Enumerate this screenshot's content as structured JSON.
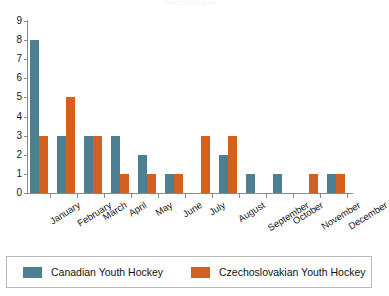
{
  "chart_data": {
    "type": "bar",
    "title": "Youth Hockey",
    "xlabel": "",
    "ylabel": "",
    "ylim": [
      0,
      9
    ],
    "yticks": [
      0,
      1,
      2,
      3,
      4,
      5,
      6,
      7,
      8,
      9
    ],
    "grid": false,
    "legend_position": "bottom",
    "categories": [
      "January",
      "February",
      "March",
      "April",
      "May",
      "June",
      "July",
      "August",
      "September",
      "October",
      "November",
      "December"
    ],
    "series": [
      {
        "name": "Canadian Youth Hockey",
        "color": "#4d7f92",
        "values": [
          8,
          3,
          3,
          3,
          2,
          1,
          0,
          2,
          1,
          1,
          0,
          1
        ]
      },
      {
        "name": "Czechoslovakian Youth Hockey",
        "color": "#d4601f",
        "values": [
          3,
          5,
          3,
          1,
          1,
          1,
          3,
          3,
          0,
          0,
          1,
          1
        ]
      }
    ]
  },
  "axis": {
    "tick_labels": [
      "0",
      "1",
      "2",
      "3",
      "4",
      "5",
      "6",
      "7",
      "8",
      "9"
    ]
  },
  "legend": {
    "items": [
      {
        "label": "Canadian Youth Hockey",
        "color": "#4d7f92"
      },
      {
        "label": "Czechoslovakian Youth Hockey",
        "color": "#d4601f"
      }
    ]
  },
  "colors": {
    "series_blue": "#4d7f92",
    "series_orange": "#d4601f",
    "axis": "#8a8a8a",
    "legend_border": "#b9b9b9",
    "background": "#ffffff"
  }
}
